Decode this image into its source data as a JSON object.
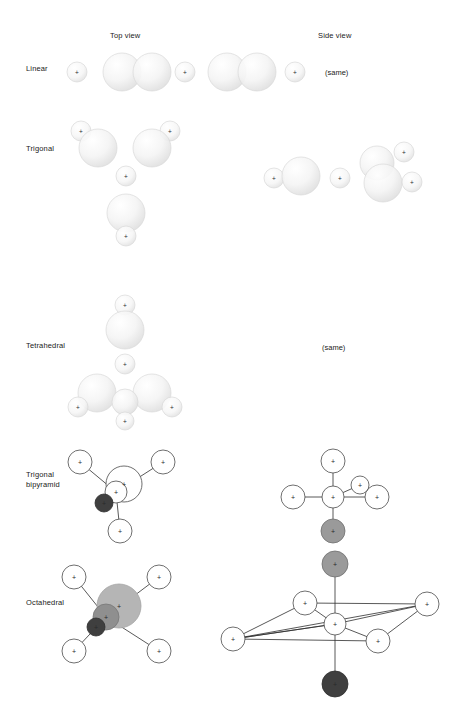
{
  "figure": {
    "title_columns": [
      {
        "label": "Top view",
        "x": 110,
        "y": 37
      },
      {
        "label": "Side view",
        "x": 318,
        "y": 37
      }
    ],
    "row_labels": [
      {
        "name": "linear",
        "label": "Linear",
        "x": 26,
        "y": 68
      },
      {
        "name": "trigonal",
        "label": "Trigonal",
        "x": 26,
        "y": 148
      },
      {
        "name": "tetrahedral",
        "label": "Tetrahedral",
        "x": 26,
        "y": 345
      },
      {
        "name": "trigonal-bipyramid",
        "label": "Trigonal\nbipyramid",
        "x": 26,
        "y": 477
      },
      {
        "name": "octahedral",
        "label": "Octahedral",
        "x": 26,
        "y": 602
      }
    ],
    "same_notes": [
      {
        "label": "(same)",
        "x": 325,
        "y": 72
      },
      {
        "label": "(same)",
        "x": 322,
        "y": 347
      }
    ],
    "plus_glyph": "+",
    "colors": {
      "background": "#ffffff",
      "text": "#1a1a1a",
      "orbital_fill": "#f3f3f3",
      "orbital_edge": "#d8d8d8",
      "orbital_shadow": "#b9b9b9",
      "outline_stroke": "#4a4a4a",
      "outline_fill": "#ffffff",
      "lobe_gray_light": "#b5b5b5",
      "lobe_gray_mid": "#8f8f8f",
      "lobe_gray_dark": "#6b6b6b",
      "lobe_dark": "#3f3f3f",
      "bond_line": "#2e2e2e"
    },
    "geometry_rows": [
      {
        "name": "linear",
        "top_view": {
          "description": "alternating small and large overlapping p-orbital lobes along a horizontal axis",
          "items": [
            {
              "type": "small-lobe",
              "cx": 77,
              "cy": 72,
              "r": 10
            },
            {
              "type": "large-lobe",
              "cx": 122,
              "cy": 72,
              "r": 19
            },
            {
              "type": "large-lobe",
              "cx": 152,
              "cy": 72,
              "r": 19
            },
            {
              "type": "small-lobe",
              "cx": 185,
              "cy": 72,
              "r": 10
            },
            {
              "type": "large-lobe",
              "cx": 227,
              "cy": 72,
              "r": 19
            },
            {
              "type": "large-lobe",
              "cx": 257,
              "cy": 72,
              "r": 19
            },
            {
              "type": "small-lobe",
              "cx": 295,
              "cy": 72,
              "r": 10
            }
          ]
        },
        "side_view": {
          "same_as_top": true
        }
      },
      {
        "name": "trigonal",
        "top_view": {
          "description": "three large lobes in a triangle each capped by a small lobe, with a small central lobe",
          "items": [
            {
              "type": "small-lobe",
              "cx": 81,
              "cy": 131,
              "r": 10
            },
            {
              "type": "large-lobe",
              "cx": 98,
              "cy": 148,
              "r": 19
            },
            {
              "type": "small-lobe",
              "cx": 170,
              "cy": 131,
              "r": 10
            },
            {
              "type": "large-lobe",
              "cx": 152,
              "cy": 148,
              "r": 19
            },
            {
              "type": "small-lobe",
              "cx": 126,
              "cy": 176,
              "r": 10
            },
            {
              "type": "large-lobe",
              "cx": 126,
              "cy": 213,
              "r": 19
            },
            {
              "type": "small-lobe",
              "cx": 126,
              "cy": 236,
              "r": 10
            }
          ]
        },
        "side_view": {
          "description": "left small lobe with large lobe, central small lobe, right cluster of two large and two small lobes",
          "items": [
            {
              "type": "small-lobe",
              "cx": 274,
              "cy": 178,
              "r": 10
            },
            {
              "type": "large-lobe",
              "cx": 301,
              "cy": 176,
              "r": 19
            },
            {
              "type": "small-lobe",
              "cx": 340,
              "cy": 178,
              "r": 10
            },
            {
              "type": "large-lobe",
              "cx": 377,
              "cy": 163,
              "r": 17
            },
            {
              "type": "small-lobe",
              "cx": 404,
              "cy": 152,
              "r": 10
            },
            {
              "type": "large-lobe",
              "cx": 383,
              "cy": 183,
              "r": 19
            },
            {
              "type": "small-lobe",
              "cx": 412,
              "cy": 182,
              "r": 10
            }
          ]
        }
      },
      {
        "name": "tetrahedral",
        "top_view": {
          "description": "one upper large lobe with small lobe above, central small lobe, two lower large lobes with small lobes and a bottom small lobe",
          "items": [
            {
              "type": "small-lobe",
              "cx": 125,
              "cy": 305,
              "r": 10
            },
            {
              "type": "large-lobe",
              "cx": 125,
              "cy": 330,
              "r": 19
            },
            {
              "type": "small-lobe",
              "cx": 125,
              "cy": 364,
              "r": 10
            },
            {
              "type": "large-lobe",
              "cx": 97,
              "cy": 393,
              "r": 19
            },
            {
              "type": "small-lobe",
              "cx": 78,
              "cy": 407,
              "r": 10
            },
            {
              "type": "large-lobe",
              "cx": 152,
              "cy": 393,
              "r": 19
            },
            {
              "type": "small-lobe",
              "cx": 172,
              "cy": 407,
              "r": 10
            },
            {
              "type": "large-lobe",
              "cx": 125,
              "cy": 402,
              "r": 13
            },
            {
              "type": "small-lobe",
              "cx": 125,
              "cy": 421,
              "r": 9
            }
          ]
        },
        "side_view": {
          "same_as_top": true
        }
      },
      {
        "name": "trigonal-bipyramid",
        "top_view": {
          "description": "outline circles radiating from a central pair, with one dark shaded circle at lower-left of centre",
          "center": {
            "cx": 120,
            "cy": 489
          },
          "items": [
            {
              "type": "outline-circle",
              "cx": 80,
              "cy": 462,
              "r": 12
            },
            {
              "type": "outline-circle",
              "cx": 163,
              "cy": 462,
              "r": 12
            },
            {
              "type": "outline-circle",
              "cx": 120,
              "cy": 531,
              "r": 12
            },
            {
              "type": "outline-circle",
              "cx": 124,
              "cy": 484,
              "r": 18
            },
            {
              "type": "outline-circle",
              "cx": 116,
              "cy": 492,
              "r": 11
            },
            {
              "type": "filled-dark-circle",
              "cx": 104,
              "cy": 503,
              "r": 9
            }
          ],
          "bonds": [
            [
              80,
              462,
              116,
              492
            ],
            [
              163,
              462,
              116,
              492
            ],
            [
              120,
              531,
              116,
              492
            ],
            [
              104,
              503,
              116,
              492
            ]
          ]
        },
        "side_view": {
          "description": "cross-shaped arrangement with a grey axial circle below the centre",
          "center": {
            "cx": 333,
            "cy": 497
          },
          "items": [
            {
              "type": "outline-circle",
              "cx": 333,
              "cy": 461,
              "r": 12
            },
            {
              "type": "outline-circle",
              "cx": 293,
              "cy": 497,
              "r": 12
            },
            {
              "type": "outline-circle",
              "cx": 377,
              "cy": 497,
              "r": 12
            },
            {
              "type": "outline-circle",
              "cx": 360,
              "cy": 485,
              "r": 9
            },
            {
              "type": "outline-circle",
              "cx": 333,
              "cy": 497,
              "r": 11
            },
            {
              "type": "filled-gray-circle",
              "cx": 333,
              "cy": 531,
              "r": 12
            }
          ],
          "bonds": [
            [
              333,
              461,
              333,
              497
            ],
            [
              293,
              497,
              333,
              497
            ],
            [
              377,
              497,
              333,
              497
            ],
            [
              360,
              485,
              333,
              497
            ],
            [
              333,
              531,
              333,
              497
            ]
          ]
        }
      },
      {
        "name": "octahedral",
        "top_view": {
          "description": "four outline circles at the corners with overlapping grey lobes at the centre",
          "center": {
            "cx": 113,
            "cy": 613
          },
          "items": [
            {
              "type": "outline-circle",
              "cx": 74,
              "cy": 577,
              "r": 12
            },
            {
              "type": "outline-circle",
              "cx": 159,
              "cy": 577,
              "r": 12
            },
            {
              "type": "outline-circle",
              "cx": 74,
              "cy": 651,
              "r": 12
            },
            {
              "type": "outline-circle",
              "cx": 159,
              "cy": 651,
              "r": 12
            },
            {
              "type": "filled-lightgray-circle",
              "cx": 119,
              "cy": 606,
              "r": 22
            },
            {
              "type": "filled-midgray-circle",
              "cx": 106,
              "cy": 617,
              "r": 13
            },
            {
              "type": "filled-dark-circle",
              "cx": 96,
              "cy": 627,
              "r": 9
            }
          ],
          "bonds": [
            [
              74,
              577,
              106,
              617
            ],
            [
              159,
              577,
              106,
              617
            ],
            [
              74,
              651,
              106,
              617
            ],
            [
              159,
              651,
              106,
              617
            ]
          ]
        },
        "side_view": {
          "description": "square-planar equatorial set drawn in perspective with grey axial circle above and dark axial circle below",
          "center": {
            "cx": 335,
            "cy": 624
          },
          "items": [
            {
              "type": "filled-gray-circle",
              "cx": 335,
              "cy": 564,
              "r": 13
            },
            {
              "type": "outline-circle",
              "cx": 305,
              "cy": 603,
              "r": 12
            },
            {
              "type": "outline-circle",
              "cx": 427,
              "cy": 604,
              "r": 12
            },
            {
              "type": "outline-circle",
              "cx": 233,
              "cy": 639,
              "r": 12
            },
            {
              "type": "outline-circle",
              "cx": 378,
              "cy": 641,
              "r": 12
            },
            {
              "type": "outline-circle",
              "cx": 335,
              "cy": 624,
              "r": 11
            },
            {
              "type": "filled-dark-circle",
              "cx": 335,
              "cy": 684,
              "r": 13
            }
          ],
          "bonds": [
            [
              335,
              564,
              335,
              624
            ],
            [
              335,
              684,
              335,
              624
            ],
            [
              305,
              603,
              335,
              624
            ],
            [
              427,
              604,
              335,
              624
            ],
            [
              233,
              639,
              335,
              624
            ],
            [
              378,
              641,
              335,
              624
            ],
            [
              305,
              603,
              427,
              604
            ],
            [
              305,
              603,
              233,
              639
            ],
            [
              233,
              639,
              378,
              641
            ],
            [
              378,
              641,
              427,
              604
            ],
            [
              233,
              639,
              427,
              604
            ],
            [
              233,
              639,
              335,
              624
            ]
          ]
        }
      }
    ]
  }
}
